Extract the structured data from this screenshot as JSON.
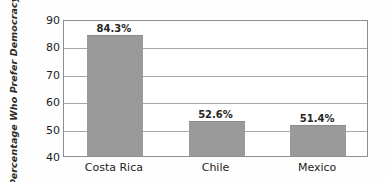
{
  "chart_data": {
    "type": "bar",
    "title": "",
    "subtitle": "",
    "xlabel": "",
    "ylabel": "Percentage Who Prefer Democracy",
    "categories": [
      "Costa Rica",
      "Chile",
      "Mexico"
    ],
    "values": [
      84.3,
      52.6,
      51.4
    ],
    "value_labels": [
      "84.3%",
      "52.6%",
      "51.4%"
    ],
    "ylim": [
      40,
      90
    ],
    "yticks": [
      40,
      50,
      60,
      70,
      80,
      90
    ],
    "ytick_labels": [
      "40",
      "50",
      "60",
      "70",
      "80",
      "90"
    ],
    "grid": "horizontal",
    "legend": "none",
    "bar_color": "#9a9a9a",
    "frame_color": "#8e8e8e",
    "gridline_color": "#a8a8a8",
    "text_color": "#1d1d1d",
    "background_color": "#ffffff"
  }
}
